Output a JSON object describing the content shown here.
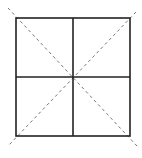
{
  "diagram": {
    "title": "",
    "elements": [
      {
        "id": "outer-square",
        "style": "solid"
      },
      {
        "id": "vertical-midline",
        "style": "solid"
      },
      {
        "id": "horizontal-midline",
        "style": "solid"
      },
      {
        "id": "diagonal-top-left-to-bottom-right",
        "style": "dashed"
      },
      {
        "id": "diagonal-top-right-to-bottom-left",
        "style": "dashed"
      }
    ],
    "colors": {
      "solid_line": "#222222",
      "dashed_line": "#777777",
      "background": "#ffffff"
    }
  }
}
